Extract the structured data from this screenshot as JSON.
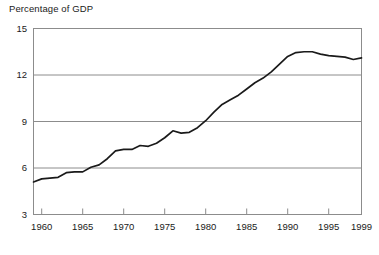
{
  "chart_data": {
    "type": "line",
    "title": "Percentage of GDP",
    "xlabel": "",
    "ylabel": "",
    "ylim": [
      3,
      15
    ],
    "xlim": [
      1959,
      1999
    ],
    "grid": "horizontal",
    "legend": "none",
    "yticks": [
      3,
      6,
      9,
      12,
      15
    ],
    "ytick_labels": [
      "3",
      "6",
      "9",
      "12",
      "15"
    ],
    "xticks": [
      1960,
      1965,
      1970,
      1975,
      1980,
      1985,
      1990,
      1995,
      1999
    ],
    "xtick_labels": [
      "1960",
      "1965",
      "1970",
      "1975",
      "1980",
      "1985",
      "1990",
      "1995",
      "1999"
    ],
    "line_color": "#1a1a1a",
    "grid_color": "#8c8c8c",
    "axis_color": "#8c8c8c",
    "series": [
      {
        "name": "Percentage of GDP",
        "x": [
          1959,
          1960,
          1961,
          1962,
          1963,
          1964,
          1965,
          1966,
          1967,
          1968,
          1969,
          1970,
          1971,
          1972,
          1973,
          1974,
          1975,
          1976,
          1977,
          1978,
          1979,
          1980,
          1981,
          1982,
          1983,
          1984,
          1985,
          1986,
          1987,
          1988,
          1989,
          1990,
          1991,
          1992,
          1993,
          1994,
          1995,
          1996,
          1997,
          1998,
          1999
        ],
        "values": [
          5.1,
          5.3,
          5.35,
          5.4,
          5.7,
          5.75,
          5.75,
          6.05,
          6.2,
          6.6,
          7.1,
          7.2,
          7.2,
          7.45,
          7.4,
          7.6,
          7.95,
          8.4,
          8.25,
          8.3,
          8.6,
          9.05,
          9.6,
          10.1,
          10.4,
          10.7,
          11.1,
          11.5,
          11.8,
          12.2,
          12.7,
          13.2,
          13.45,
          13.5,
          13.5,
          13.35,
          13.25,
          13.2,
          13.15,
          13.0,
          13.1
        ]
      }
    ]
  }
}
